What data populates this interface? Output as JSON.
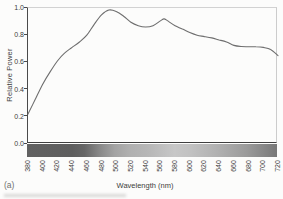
{
  "figure": {
    "panel_label": "(a)",
    "background_color": "#fcfcfb"
  },
  "chart_data": {
    "type": "line",
    "title": "",
    "xlabel": "Wavelength (nm)",
    "ylabel": "Relative Power",
    "xlim": [
      380,
      720
    ],
    "ylim": [
      0.0,
      1.0
    ],
    "grid": false,
    "legend": null,
    "line_color": "#6e6e6e",
    "axis_color": "#4a4a4a",
    "frame_color": "#cccccc",
    "x_tick_labels": [
      "380",
      "400",
      "420",
      "440",
      "460",
      "480",
      "500",
      "520",
      "540",
      "560",
      "580",
      "600",
      "620",
      "640",
      "660",
      "680",
      "700",
      "720"
    ],
    "y_tick_labels": [
      "1.0",
      "0.8",
      "0.6",
      "0.4",
      "0.2",
      "0.0"
    ],
    "series": [
      {
        "name": "relative-power",
        "x": [
          380,
          390,
          400,
          410,
          420,
          430,
          440,
          450,
          460,
          470,
          480,
          490,
          500,
          510,
          520,
          530,
          540,
          550,
          560,
          565,
          570,
          580,
          590,
          600,
          610,
          620,
          630,
          640,
          650,
          660,
          670,
          680,
          690,
          700,
          710,
          720
        ],
        "y": [
          0.22,
          0.33,
          0.44,
          0.53,
          0.61,
          0.67,
          0.71,
          0.75,
          0.8,
          0.88,
          0.95,
          0.985,
          0.975,
          0.94,
          0.895,
          0.87,
          0.86,
          0.87,
          0.905,
          0.92,
          0.905,
          0.87,
          0.845,
          0.82,
          0.8,
          0.79,
          0.78,
          0.765,
          0.75,
          0.725,
          0.717,
          0.715,
          0.715,
          0.71,
          0.695,
          0.65
        ]
      }
    ],
    "spectrum_bar": {
      "description": "grayscale spectrum strip under x-axis",
      "stops": [
        {
          "pos": 0,
          "color": "#616161"
        },
        {
          "pos": 18,
          "color": "#5e5e5e"
        },
        {
          "pos": 23,
          "color": "#666666"
        },
        {
          "pos": 29,
          "color": "#888888"
        },
        {
          "pos": 35,
          "color": "#a3a3a3"
        },
        {
          "pos": 41,
          "color": "#b0b0b0"
        },
        {
          "pos": 48,
          "color": "#b6b6b6"
        },
        {
          "pos": 59,
          "color": "#c7c7c7"
        },
        {
          "pos": 65,
          "color": "#c2c2c2"
        },
        {
          "pos": 76,
          "color": "#b1b1b1"
        },
        {
          "pos": 88,
          "color": "#9a9a9a"
        },
        {
          "pos": 100,
          "color": "#787878"
        }
      ]
    }
  }
}
